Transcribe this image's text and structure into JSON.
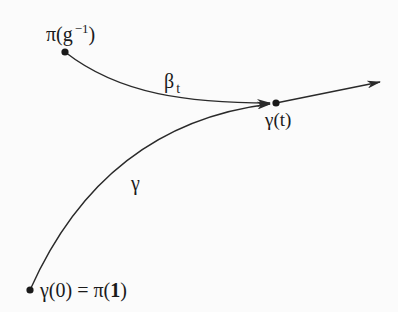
{
  "diagram": {
    "type": "path-lifting diagram",
    "points": {
      "pi_g_inv": {
        "label_main": "π(g",
        "label_sup": "−1",
        "label_close": ")",
        "x": 65,
        "y": 52
      },
      "gamma_t": {
        "label": "γ(t)",
        "x": 276,
        "y": 103
      },
      "gamma_0": {
        "label_lhs": "γ(0) = π(",
        "label_bold": "1",
        "label_rhs": ")",
        "x": 30,
        "y": 290
      }
    },
    "curves": {
      "beta_t": {
        "label_main": "β",
        "label_sub": "t",
        "from": "pi_g_inv",
        "to": "gamma_t",
        "arrow": true
      },
      "gamma": {
        "label": "γ",
        "from": "gamma_0",
        "to": "gamma_t",
        "arrow": true
      },
      "tangent": {
        "from": "gamma_t",
        "to": [
          380,
          82
        ],
        "arrow": true
      }
    },
    "colors": {
      "stroke": "#2a2a2a",
      "text": "#1a1a1a",
      "background": "#fbfbfb"
    }
  }
}
